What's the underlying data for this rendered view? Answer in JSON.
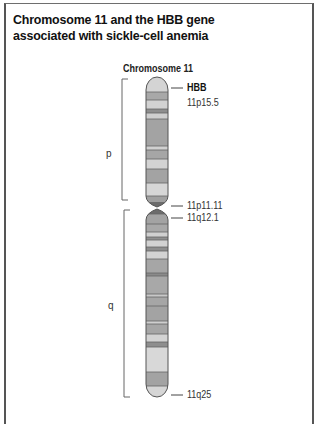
{
  "title": "Chromosome 11 and the HBB gene associated with sickle-cell anemia",
  "chromosome_label": "Chromosome 11",
  "arms": {
    "p": "p",
    "q": "q"
  },
  "markers": [
    {
      "id": "hbb",
      "label": "HBB",
      "bold": true
    },
    {
      "id": "p15_5",
      "label": "11p15.5",
      "bold": false
    },
    {
      "id": "p11_11",
      "label": "11p11.11",
      "bold": false
    },
    {
      "id": "q12_1",
      "label": "11q12.1",
      "bold": false
    },
    {
      "id": "q25",
      "label": "11q25",
      "bold": false
    }
  ],
  "colors": {
    "light_band": "#d6d6d6",
    "mid_band": "#a9a9a9",
    "dark_band": "#8a8a8a",
    "centromere": "#6f6f6f",
    "outline": "#555555"
  }
}
